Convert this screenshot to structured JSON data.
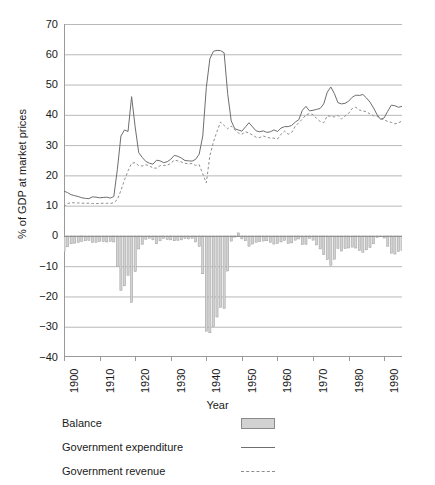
{
  "chart_data": {
    "type": "bar",
    "title": "",
    "xlabel": "Year",
    "ylabel": "% of GDP at market prices",
    "xlim": [
      1900,
      1995
    ],
    "ylim": [
      -40,
      70
    ],
    "grid": true,
    "legend_position": "below-plot",
    "y_ticks": [
      70,
      60,
      50,
      40,
      30,
      20,
      10,
      0,
      -10,
      -20,
      -30,
      -40
    ],
    "y_tick_labels": [
      "70",
      "60",
      "50",
      "40",
      "30",
      "20",
      "10",
      "0",
      "-10",
      "-20",
      "-30",
      "-40"
    ],
    "x_ticks": [
      1900,
      1910,
      1920,
      1930,
      1940,
      1950,
      1960,
      1970,
      1980,
      1990
    ],
    "x_tick_labels": [
      "1900",
      "1910",
      "1920",
      "1930",
      "1940",
      "1950",
      "1960",
      "1970",
      "1980",
      "1990"
    ],
    "x": [
      1900,
      1901,
      1902,
      1903,
      1904,
      1905,
      1906,
      1907,
      1908,
      1909,
      1910,
      1911,
      1912,
      1913,
      1914,
      1915,
      1916,
      1917,
      1918,
      1919,
      1920,
      1921,
      1922,
      1923,
      1924,
      1925,
      1926,
      1927,
      1928,
      1929,
      1930,
      1931,
      1932,
      1933,
      1934,
      1935,
      1936,
      1937,
      1938,
      1939,
      1940,
      1941,
      1942,
      1943,
      1944,
      1945,
      1946,
      1947,
      1948,
      1949,
      1950,
      1951,
      1952,
      1953,
      1954,
      1955,
      1956,
      1957,
      1958,
      1959,
      1960,
      1961,
      1962,
      1963,
      1964,
      1965,
      1966,
      1967,
      1968,
      1969,
      1970,
      1971,
      1972,
      1973,
      1974,
      1975,
      1976,
      1977,
      1978,
      1979,
      1980,
      1981,
      1982,
      1983,
      1984,
      1985,
      1986,
      1987,
      1988,
      1989,
      1990,
      1991,
      1992,
      1993,
      1994,
      1995
    ],
    "series": [
      {
        "name": "Government expenditure",
        "style": "solid-line",
        "color": "#6e6e6e",
        "values": [
          14.8,
          14.3,
          13.6,
          13.3,
          13.0,
          12.6,
          12.4,
          12.3,
          12.9,
          12.8,
          12.6,
          12.7,
          12.8,
          12.5,
          13.0,
          22.0,
          33.0,
          35.0,
          34.5,
          46.0,
          36.0,
          27.5,
          25.9,
          24.6,
          24.0,
          23.7,
          25.0,
          24.8,
          24.2,
          24.5,
          25.3,
          26.6,
          26.3,
          25.7,
          24.9,
          24.8,
          24.7,
          25.3,
          27.0,
          33.0,
          49.0,
          58.5,
          61.0,
          61.3,
          61.2,
          60.5,
          47.0,
          38.0,
          35.4,
          35.0,
          34.6,
          36.0,
          37.4,
          36.0,
          34.7,
          34.4,
          34.7,
          34.2,
          34.4,
          35.0,
          34.5,
          35.6,
          36.1,
          36.1,
          36.5,
          37.6,
          38.4,
          41.5,
          42.8,
          41.3,
          41.5,
          41.8,
          42.1,
          43.6,
          47.5,
          49.2,
          47.0,
          44.0,
          43.6,
          43.8,
          44.5,
          45.8,
          46.5,
          46.4,
          46.7,
          45.6,
          44.2,
          42.3,
          40.0,
          38.5,
          39.0,
          41.2,
          43.2,
          43.0,
          42.5,
          42.8
        ]
      },
      {
        "name": "Government revenue",
        "style": "dashed-line",
        "color": "#8d8d8d",
        "values": [
          9.6,
          10.7,
          11.0,
          10.9,
          10.9,
          10.8,
          10.8,
          10.8,
          10.7,
          10.7,
          10.7,
          10.8,
          10.8,
          10.7,
          11.0,
          12.0,
          15.0,
          18.5,
          21.5,
          24.0,
          24.2,
          23.2,
          23.1,
          23.5,
          23.2,
          22.4,
          22.4,
          23.2,
          23.3,
          23.3,
          24.0,
          25.0,
          24.8,
          24.4,
          24.0,
          23.8,
          23.9,
          23.3,
          23.5,
          20.5,
          17.5,
          26.5,
          31.0,
          34.5,
          37.6,
          36.5,
          35.4,
          36.3,
          35.0,
          34.0,
          33.6,
          34.4,
          34.0,
          33.3,
          32.6,
          32.5,
          33.0,
          32.6,
          32.3,
          32.3,
          32.0,
          33.6,
          34.6,
          33.6,
          34.2,
          36.2,
          37.4,
          38.6,
          40.0,
          40.4,
          40.1,
          38.8,
          37.8,
          37.4,
          39.7,
          39.5,
          39.3,
          39.8,
          38.6,
          39.6,
          40.5,
          42.1,
          42.5,
          41.6,
          41.3,
          41.0,
          40.3,
          39.7,
          39.5,
          38.8,
          38.3,
          37.8,
          37.5,
          37.0,
          37.3,
          38.0
        ]
      },
      {
        "name": "Balance",
        "style": "bar",
        "color": "#d2d2d2",
        "values": [
          -5.2,
          -3.6,
          -2.6,
          -2.4,
          -2.1,
          -1.8,
          -1.6,
          -1.5,
          -2.2,
          -2.1,
          -1.9,
          -1.9,
          -2.0,
          -1.8,
          -2.0,
          -10.0,
          -18.0,
          -16.5,
          -13.0,
          -22.0,
          -11.8,
          -4.3,
          -2.8,
          -1.1,
          -0.8,
          -1.3,
          -2.6,
          -1.6,
          -0.9,
          -1.2,
          -1.3,
          -1.6,
          -1.5,
          -1.3,
          -0.9,
          -1.0,
          -0.8,
          -2.0,
          -3.5,
          -12.5,
          -31.5,
          -32.0,
          -30.0,
          -26.8,
          -23.6,
          -24.0,
          -11.6,
          -1.7,
          -0.4,
          1.0,
          -1.0,
          -1.6,
          -3.4,
          -2.7,
          -2.1,
          -1.9,
          -1.7,
          -1.6,
          -2.1,
          -2.7,
          -2.5,
          -2.0,
          -1.5,
          -2.5,
          -2.3,
          -1.4,
          -1.0,
          -2.9,
          -2.8,
          -0.9,
          -1.4,
          -3.0,
          -4.3,
          -6.2,
          -7.8,
          -9.7,
          -7.7,
          -4.2,
          -5.0,
          -4.2,
          -4.0,
          -3.7,
          -4.0,
          -4.8,
          -5.4,
          -4.6,
          -3.9,
          -2.6,
          -0.5,
          -0.3,
          -0.7,
          -3.4,
          -5.7,
          -6.0,
          -5.2,
          -4.8
        ]
      }
    ]
  },
  "axes": {
    "y_title": "% of GDP at market prices",
    "x_title": "Year"
  },
  "legend": {
    "items": [
      {
        "label": "Balance",
        "key": "swatch"
      },
      {
        "label": "Government expenditure",
        "key": "solid"
      },
      {
        "label": "Government revenue",
        "key": "dash"
      }
    ]
  }
}
